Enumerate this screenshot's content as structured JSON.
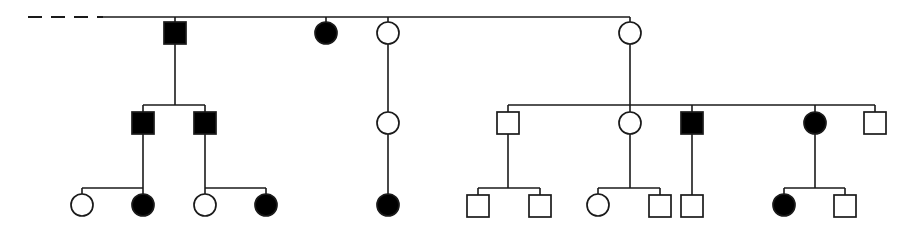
{
  "figure": {
    "kind": "pedigree-chart",
    "width": 919,
    "height": 225,
    "background_color": "#ffffff",
    "line_color": "#1a1a1a",
    "affected_fill": "#000000",
    "unaffected_fill": "#ffffff"
  },
  "legend_semantics": {
    "square": "male",
    "circle": "female",
    "filled": "affected",
    "open": "unaffected",
    "dashed_line": "lineage continues off-chart to the left"
  },
  "generations": [
    {
      "id": "generation-1",
      "label": "I",
      "symbol_center_y": 33,
      "sibship_line_y": 17,
      "members": [
        {
          "id": "I-1",
          "sex": "male",
          "shape": "square",
          "status": "affected",
          "x": 175,
          "y": 33
        },
        {
          "id": "I-2",
          "sex": "female",
          "shape": "circle",
          "status": "affected",
          "x": 326,
          "y": 33
        },
        {
          "id": "I-3",
          "sex": "female",
          "shape": "circle",
          "status": "unaffected",
          "x": 388,
          "y": 33
        },
        {
          "id": "I-4",
          "sex": "female",
          "shape": "circle",
          "status": "unaffected",
          "x": 630,
          "y": 33
        }
      ]
    },
    {
      "id": "generation-2",
      "label": "II",
      "symbol_center_y": 123,
      "members": [
        {
          "id": "II-1",
          "sex": "male",
          "shape": "square",
          "status": "affected",
          "x": 143,
          "y": 123
        },
        {
          "id": "II-2",
          "sex": "male",
          "shape": "square",
          "status": "affected",
          "x": 205,
          "y": 123
        },
        {
          "id": "II-3",
          "sex": "female",
          "shape": "circle",
          "status": "unaffected",
          "x": 388,
          "y": 123
        },
        {
          "id": "II-4",
          "sex": "male",
          "shape": "square",
          "status": "unaffected",
          "x": 508,
          "y": 123
        },
        {
          "id": "II-5",
          "sex": "female",
          "shape": "circle",
          "status": "unaffected",
          "x": 630,
          "y": 123
        },
        {
          "id": "II-6",
          "sex": "male",
          "shape": "square",
          "status": "affected",
          "x": 692,
          "y": 123
        },
        {
          "id": "II-7",
          "sex": "female",
          "shape": "circle",
          "status": "affected",
          "x": 815,
          "y": 123
        },
        {
          "id": "II-8",
          "sex": "male",
          "shape": "square",
          "status": "unaffected",
          "x": 875,
          "y": 123
        }
      ]
    },
    {
      "id": "generation-3",
      "label": "III",
      "symbol_center_y": 205,
      "members": [
        {
          "id": "III-1",
          "sex": "female",
          "shape": "circle",
          "status": "unaffected",
          "x": 82,
          "y": 205
        },
        {
          "id": "III-2",
          "sex": "female",
          "shape": "circle",
          "status": "affected",
          "x": 143,
          "y": 205
        },
        {
          "id": "III-3",
          "sex": "female",
          "shape": "circle",
          "status": "unaffected",
          "x": 205,
          "y": 205
        },
        {
          "id": "III-4",
          "sex": "female",
          "shape": "circle",
          "status": "affected",
          "x": 266,
          "y": 205
        },
        {
          "id": "III-5",
          "sex": "female",
          "shape": "circle",
          "status": "affected",
          "x": 388,
          "y": 205
        },
        {
          "id": "III-6",
          "sex": "male",
          "shape": "square",
          "status": "unaffected",
          "x": 478,
          "y": 205
        },
        {
          "id": "III-7",
          "sex": "male",
          "shape": "square",
          "status": "unaffected",
          "x": 540,
          "y": 205
        },
        {
          "id": "III-8",
          "sex": "female",
          "shape": "circle",
          "status": "unaffected",
          "x": 598,
          "y": 205
        },
        {
          "id": "III-9",
          "sex": "male",
          "shape": "square",
          "status": "unaffected",
          "x": 660,
          "y": 205
        },
        {
          "id": "III-10",
          "sex": "male",
          "shape": "square",
          "status": "unaffected",
          "x": 692,
          "y": 205
        },
        {
          "id": "III-11",
          "sex": "female",
          "shape": "circle",
          "status": "affected",
          "x": 784,
          "y": 205
        },
        {
          "id": "III-12",
          "sex": "male",
          "shape": "square",
          "status": "unaffected",
          "x": 845,
          "y": 205
        }
      ]
    }
  ],
  "geometry": {
    "square_size": 22,
    "circle_radius": 11,
    "gen1_sibship_line": {
      "y": 17,
      "x_start": 100,
      "x_end": 630
    },
    "dashed_continuation": {
      "y": 17,
      "x_start": 28,
      "x_end": 103
    },
    "gen2_left_sibship": {
      "y": 105,
      "x_start": 143,
      "x_end": 205,
      "parent_x": 175
    },
    "gen2_right_sibship": {
      "y": 105,
      "x_start": 508,
      "x_end": 875,
      "parent_x": 630
    },
    "gen3_sibships": [
      {
        "id": "sib-a",
        "y": 188,
        "x_start": 82,
        "x_end": 143,
        "parent_x": 143
      },
      {
        "id": "sib-b",
        "y": 188,
        "x_start": 205,
        "x_end": 266,
        "parent_x": 205
      },
      {
        "id": "sib-c",
        "y": 188,
        "x_start": 478,
        "x_end": 540,
        "parent_x": 508
      },
      {
        "id": "sib-d",
        "y": 188,
        "x_start": 598,
        "x_end": 660,
        "parent_x": 630
      },
      {
        "id": "sib-e",
        "y": 188,
        "x_start": 784,
        "x_end": 845,
        "parent_x": 815
      }
    ]
  },
  "counts": {
    "total_individuals": 24,
    "affected_total": 9,
    "generation_1_total": 4,
    "generation_2_total": 8,
    "generation_3_total": 12
  }
}
